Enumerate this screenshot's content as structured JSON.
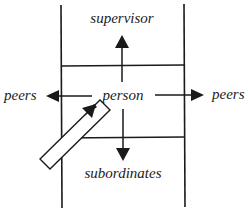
{
  "diagram": {
    "labels": {
      "top": "supervisor",
      "center": "person",
      "left": "peers",
      "right": "peers",
      "bottom": "subordinates"
    },
    "colors": {
      "stroke": "#1a1a1a",
      "background": "#ffffff"
    }
  }
}
